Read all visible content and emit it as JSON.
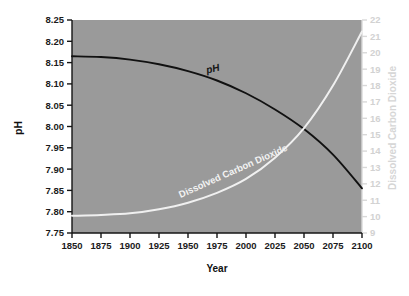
{
  "chart_data": {
    "type": "line",
    "title": "",
    "subtitle": "",
    "xlabel": "Year",
    "ylabel": "pH",
    "y2label": "Dissolved Carbon Dioxide",
    "xlim": [
      1850,
      2100
    ],
    "ylim": [
      7.75,
      8.25
    ],
    "y2lim": [
      9,
      22
    ],
    "grid": false,
    "legend_position": "inline-curve-labels",
    "background": "#9a9a9a",
    "xticks": [
      1850,
      1875,
      1900,
      1925,
      1950,
      1975,
      2000,
      2025,
      2050,
      2075,
      2100
    ],
    "xtick_labels": [
      "1850",
      "1875",
      "1900",
      "1925",
      "1950",
      "1975",
      "2000",
      "2025",
      "2050",
      "2075",
      "2100"
    ],
    "yticks": [
      7.75,
      7.8,
      7.85,
      7.9,
      7.95,
      8.0,
      8.05,
      8.1,
      8.15,
      8.2,
      8.25
    ],
    "ytick_labels": [
      "7.75",
      "7.80",
      "7.85",
      "7.90",
      "7.95",
      "8.00",
      "8.05",
      "8.10",
      "8.15",
      "8.20",
      "8.25"
    ],
    "y2ticks": [
      9,
      10,
      11,
      12,
      13,
      14,
      15,
      16,
      17,
      18,
      19,
      20,
      21,
      22
    ],
    "y2tick_labels": [
      "9",
      "10",
      "11",
      "12",
      "13",
      "14",
      "15",
      "16",
      "17",
      "18",
      "19",
      "20",
      "21",
      "22"
    ],
    "x": [
      1850,
      1875,
      1900,
      1925,
      1950,
      1975,
      2000,
      2025,
      2050,
      2075,
      2100
    ],
    "series": [
      {
        "name": "pH",
        "axis": "left",
        "color": "#111111",
        "label_text": "pH",
        "label_x": 1972,
        "label_y": 8.128,
        "label_rotation": -13,
        "values": [
          8.165,
          8.163,
          8.157,
          8.146,
          8.13,
          8.108,
          8.078,
          8.04,
          7.994,
          7.934,
          7.855
        ]
      },
      {
        "name": "Dissolved Carbon Dioxide",
        "axis": "right",
        "color": "#f0f0f0",
        "label_text": "Dissolved Carbon Dioxide",
        "label_x": 1990,
        "label_y": 12.6,
        "label_rotation": -24,
        "values": [
          10.05,
          10.1,
          10.2,
          10.45,
          10.85,
          11.45,
          12.3,
          13.6,
          15.4,
          18.0,
          21.3
        ]
      }
    ]
  }
}
